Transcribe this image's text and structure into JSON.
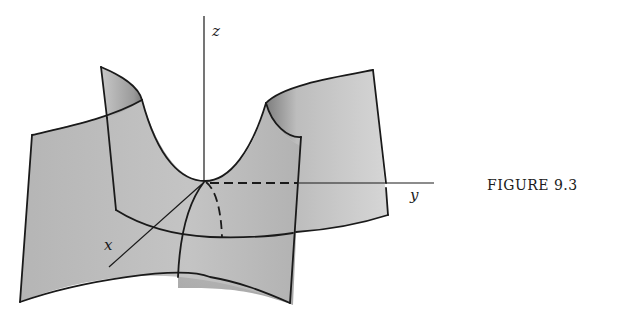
{
  "figure": {
    "caption": "FIGURE 9.3",
    "axes": {
      "x_label": "x",
      "y_label": "y",
      "z_label": "z"
    },
    "colors": {
      "surface_light": "#d8d8d8",
      "surface_mid": "#b9b9b9",
      "surface_dark": "#8f8f8f",
      "stroke": "#1a1a1a",
      "background": "#ffffff"
    }
  }
}
